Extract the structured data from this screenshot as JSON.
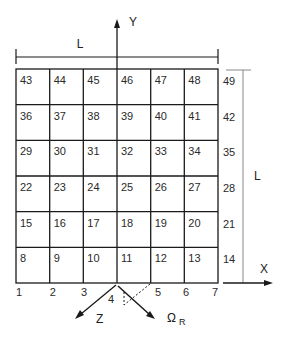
{
  "diagram": {
    "type": "numbered-grid-with-axes",
    "grid": {
      "columns": 6,
      "rows": 6,
      "cell_labels": [
        [
          "43",
          "44",
          "45",
          "46",
          "47",
          "48"
        ],
        [
          "36",
          "37",
          "38",
          "39",
          "40",
          "41"
        ],
        [
          "29",
          "30",
          "31",
          "32",
          "33",
          "34"
        ],
        [
          "22",
          "23",
          "24",
          "25",
          "26",
          "27"
        ],
        [
          "15",
          "16",
          "17",
          "18",
          "19",
          "20"
        ],
        [
          "8",
          "9",
          "10",
          "11",
          "12",
          "13"
        ]
      ],
      "right_column_labels": [
        "49",
        "42",
        "35",
        "28",
        "21",
        "14"
      ],
      "bottom_node_labels": [
        "1",
        "2",
        "3",
        "4",
        "5",
        "6",
        "7"
      ]
    },
    "dimensions": {
      "top_width_label": "L",
      "right_height_label": "L"
    },
    "axes": {
      "y_label": "Y",
      "x_label": "X",
      "z_label": "Z",
      "omega_label": "Ω",
      "omega_subscript": "R"
    },
    "colors": {
      "line": "#1a1a1a",
      "dim_line": "#888888"
    }
  }
}
